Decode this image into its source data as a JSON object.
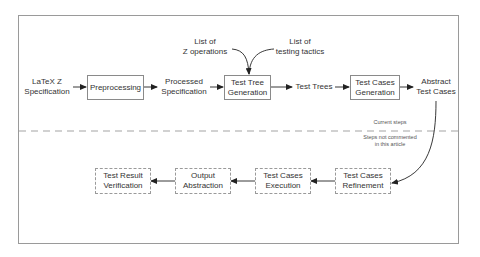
{
  "diagram": {
    "colors": {
      "line": "#333333",
      "frame": "#9a9a9a",
      "box_border": "#8a8a8a",
      "text": "#333333"
    },
    "current_steps": {
      "inputs": {
        "latex_spec": [
          "LaTeX Z",
          "Specification"
        ],
        "z_operations": [
          "List of",
          "Z operations"
        ],
        "testing_tactics": [
          "List of",
          "testing tactics"
        ]
      },
      "boxes": {
        "preprocessing": [
          "Preprocessing"
        ],
        "test_tree_generation": [
          "Test Tree",
          "Generation"
        ],
        "test_cases_generation": [
          "Test Cases",
          "Generation"
        ]
      },
      "artifacts": {
        "processed_spec": [
          "Processed",
          "Specification"
        ],
        "test_trees": [
          "Test Trees"
        ],
        "abstract_test_cases": [
          "Abstract",
          "Test Cases"
        ]
      }
    },
    "divider": {
      "above_label": "Current steps",
      "below_label": [
        "Steps not commented",
        "in this article"
      ]
    },
    "future_steps": {
      "boxes": {
        "refinement": [
          "Test Cases",
          "Refinement"
        ],
        "execution": [
          "Test Cases",
          "Execution"
        ],
        "output_abstraction": [
          "Output",
          "Abstraction"
        ],
        "verification": [
          "Test Result",
          "Verification"
        ]
      }
    }
  }
}
